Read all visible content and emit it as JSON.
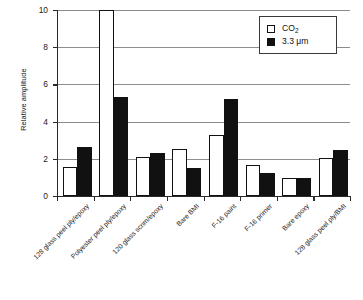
{
  "chart_data": {
    "type": "bar",
    "title": "",
    "subtitle": "",
    "xlabel": "",
    "ylabel": "Relative amplitude",
    "ylim": [
      0,
      10
    ],
    "yticks": [
      0,
      2,
      4,
      6,
      8,
      10
    ],
    "grid": true,
    "grid_axis": "y",
    "legend_position": "top-right",
    "categories": [
      "128 glass peel ply/epoxy",
      "Polyester peel ply/epoxy",
      "120 glass scrim/epoxy",
      "Bare BMI",
      "F-16 paint",
      "F-16 primer",
      "Bare epoxy",
      "128 glass peel ply/BMI"
    ],
    "series": [
      {
        "name": "CO2",
        "label": "CO",
        "label_sub": "2",
        "color": "#ffffff",
        "edge_color": "#111111",
        "values": [
          1.55,
          10.0,
          2.1,
          2.55,
          3.3,
          1.65,
          0.95,
          2.05
        ]
      },
      {
        "name": "3.3 um",
        "label": "3.3 μm",
        "color": "#111111",
        "edge_color": "#111111",
        "values": [
          2.65,
          5.35,
          2.3,
          1.5,
          5.2,
          1.25,
          0.95,
          2.5
        ]
      }
    ]
  },
  "axis": {
    "y_title": "Relative amplitude",
    "tick_labels": [
      "0",
      "2",
      "4",
      "6",
      "8",
      "10"
    ]
  },
  "legend": {
    "items": [
      {
        "label": "CO",
        "sub": "2",
        "style": "open"
      },
      {
        "label": "3.3 μm",
        "sub": "",
        "style": "filled"
      }
    ]
  }
}
